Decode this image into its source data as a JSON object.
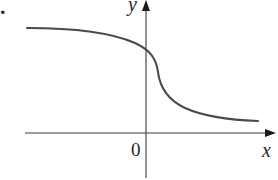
{
  "figure": {
    "problem_number": ".",
    "x_axis_label": "x",
    "y_axis_label": "y",
    "origin_label": "0",
    "colors": {
      "axis": "#3a3a3a",
      "curve": "#4a4a4a",
      "text": "#2a2a2a",
      "background": "#ffffff"
    },
    "axes": {
      "origin_px": [
        146,
        133
      ],
      "x_axis_px": {
        "from": [
          25,
          133
        ],
        "to": [
          275,
          133
        ]
      },
      "y_axis_px": {
        "from": [
          146,
          178
        ],
        "to": [
          146,
          0
        ]
      }
    },
    "curve": {
      "description": "Decreasing curve: horizontal asymptote on the left above the x-axis, steep drop just right of the y-axis, leveling off toward a lower horizontal asymptote above the x-axis on the right",
      "path_points_px": [
        [
          27,
          28
        ],
        [
          80,
          30
        ],
        [
          120,
          38
        ],
        [
          146,
          52
        ],
        [
          155,
          62
        ],
        [
          160,
          85
        ],
        [
          175,
          103
        ],
        [
          200,
          113
        ],
        [
          230,
          119
        ],
        [
          258,
          121
        ]
      ]
    }
  }
}
